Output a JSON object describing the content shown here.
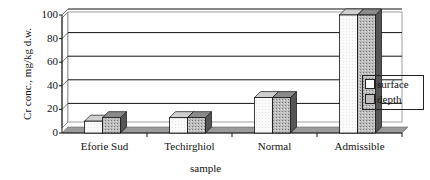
{
  "chart_data": {
    "type": "bar",
    "title": "",
    "xlabel": "sample",
    "ylabel": "Cr conc., mg/kg d.w.",
    "categories": [
      "Eforie Sud",
      "Techirghiol",
      "Normal",
      "Admissible"
    ],
    "series": [
      {
        "name": "surface",
        "values": [
          10,
          13,
          30,
          100
        ]
      },
      {
        "name": "depth",
        "values": [
          13,
          13,
          30,
          100
        ]
      }
    ],
    "ylim": [
      0,
      100
    ],
    "yticks": [
      "0",
      "20",
      "40",
      "60",
      "80",
      "100"
    ],
    "grid": true,
    "legend_position": "right",
    "style": "3d-clustered-bar"
  },
  "legend": {
    "items": [
      "surface",
      "depth"
    ]
  }
}
